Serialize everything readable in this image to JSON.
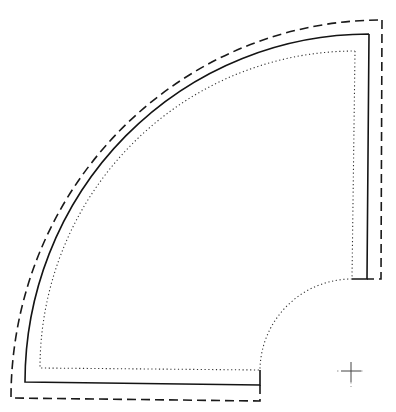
{
  "diagram": {
    "type": "quilt-pattern-piece",
    "shape": "fan-blade-quarter-ring",
    "colors": {
      "background": "#ffffff",
      "line": "#1a1a1a"
    },
    "lines": [
      {
        "name": "cutting-line",
        "style": "dashed"
      },
      {
        "name": "seam-line",
        "style": "solid"
      },
      {
        "name": "quilting-line",
        "style": "dotted"
      }
    ],
    "center_mark": {
      "symbol": "+",
      "x": 351,
      "y": 371
    }
  }
}
